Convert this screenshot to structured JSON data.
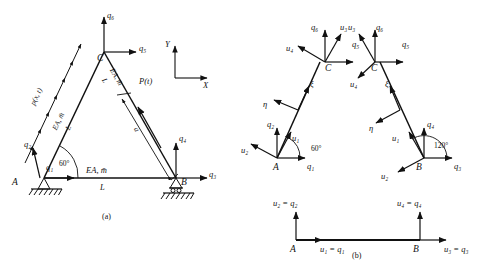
{
  "figure": {
    "caption_a": "(a)",
    "caption_b": "(b)"
  },
  "panel_a": {
    "nodes": {
      "A": "A",
      "B": "B",
      "C": "C"
    },
    "forces": {
      "q1": "q₁",
      "q2": "q₂",
      "q3": "q₃",
      "q4": "q₄",
      "q5": "q₅",
      "q6": "q₆"
    },
    "loads": {
      "distributed": "p(x, t)",
      "concentrated": "P(t)",
      "distance": "a"
    },
    "members": {
      "left_prop": "EA, m̄",
      "left_len": "L",
      "right_prop": "EA, m̄",
      "right_len": "L",
      "bottom_prop": "EA, m̄",
      "bottom_len": "L"
    },
    "angle": "60°",
    "axes": {
      "x": "X",
      "y": "Y"
    },
    "supports": {
      "A": "pin-support",
      "B": "roller-support"
    }
  },
  "panel_b": {
    "nodes": {
      "A": "A",
      "B": "B",
      "C_left": "C",
      "C_right": "C"
    },
    "forces": {
      "q1": "q₁",
      "q2": "q₂",
      "q3": "q₃",
      "q4": "q₄",
      "q5": "q₅",
      "q6": "q₆"
    },
    "displacements": {
      "u1": "u₁",
      "u2": "u₂",
      "u3": "u₃",
      "u4": "u₄"
    },
    "local_axes": {
      "xi": "ξ",
      "eta": "η"
    },
    "angles": {
      "at_A": "60°",
      "at_B": "120°"
    },
    "equalities": {
      "u2q2": "u₂  =  q₂",
      "u4q4": "u₄  =  q₄",
      "u1q1": "u₁  =  q₁",
      "u3q3": "u₃  =  q₃"
    }
  },
  "style": {
    "ink": "#111111",
    "background": "#ffffff"
  }
}
